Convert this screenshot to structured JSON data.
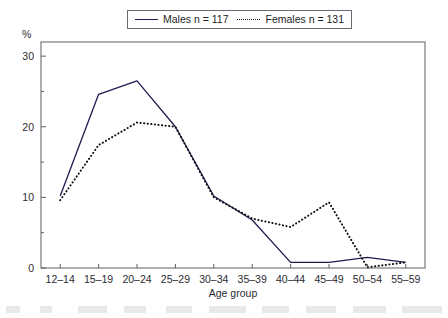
{
  "figure": {
    "y_unit_label": "%",
    "legend": {
      "entries": [
        {
          "label": "Males n = 117",
          "style": "solid",
          "color": "#1c1c4e",
          "icon": "solid-line-icon"
        },
        {
          "label": "Females n = 131",
          "style": "dotted",
          "color": "#101016",
          "icon": "dotted-line-icon"
        }
      ]
    }
  },
  "chart_data": {
    "type": "line",
    "title": "",
    "subtitle": "",
    "xlabel": "Age group",
    "ylabel": "%",
    "categories": [
      "12–14",
      "15–19",
      "20–24",
      "25–29",
      "30–34",
      "35–39",
      "40–44",
      "45–49",
      "50–54",
      "55–59"
    ],
    "ylim": [
      0,
      32
    ],
    "yticks": [
      0,
      10,
      20,
      30
    ],
    "ytick_labels": [
      "0",
      "10",
      "20",
      "30"
    ],
    "yminor_ticks": [
      5,
      15,
      25
    ],
    "grid": false,
    "legend_position": "top-center",
    "series": [
      {
        "name": "Males n = 117",
        "style": "solid",
        "color": "#1c1c4e",
        "values": [
          10.2,
          24.6,
          26.5,
          20.0,
          10.2,
          6.8,
          0.8,
          0.8,
          1.5,
          0.8
        ]
      },
      {
        "name": "Females n = 131",
        "style": "dotted",
        "color": "#101016",
        "values": [
          9.6,
          17.4,
          20.6,
          20.0,
          10.0,
          7.0,
          5.8,
          9.3,
          0.1,
          0.8
        ]
      }
    ]
  }
}
